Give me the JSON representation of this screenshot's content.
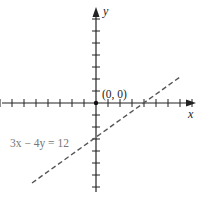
{
  "diagram": {
    "type": "coordinate-plane",
    "axes": {
      "x_label": "x",
      "y_label": "y",
      "x_ticks": [
        -8,
        -7,
        -6,
        -5,
        -4,
        -3,
        -2,
        -1,
        1,
        2,
        3,
        4,
        5,
        6,
        7,
        8
      ],
      "y_ticks": [
        -7,
        -6,
        -5,
        -4,
        -3,
        -2,
        -1,
        1,
        2,
        3,
        4,
        5,
        6,
        7
      ],
      "axis_color": "#222222"
    },
    "origin": {
      "label": "(0, 0)",
      "point": [
        0,
        0
      ]
    },
    "line": {
      "equation_label": "3x − 4y = 12",
      "style": "dashed",
      "color": "#555555",
      "label_color": "#777777",
      "x_intercept": [
        4,
        0
      ],
      "y_intercept": [
        0,
        -3
      ],
      "endpoints": [
        [
          -5.3,
          -7
        ],
        [
          7,
          2.25
        ]
      ]
    }
  }
}
